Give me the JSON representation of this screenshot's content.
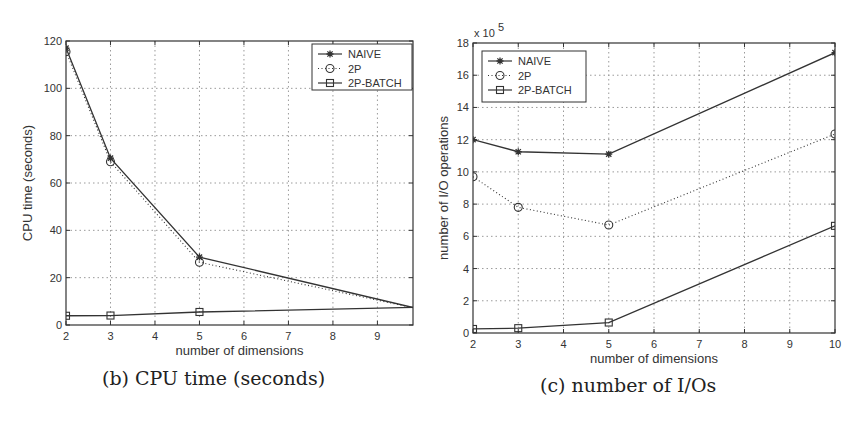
{
  "chart_data": [
    {
      "type": "line",
      "caption": "(b) CPU time (seconds)",
      "title": "",
      "xlabel": "number of dimensions",
      "ylabel": "CPU time (seconds)",
      "xlim": [
        2,
        9.8
      ],
      "ylim": [
        0,
        120
      ],
      "xticks": [
        2,
        3,
        4,
        5,
        6,
        7,
        8,
        9
      ],
      "yticks": [
        0,
        20,
        40,
        60,
        80,
        100,
        120
      ],
      "y_multiplier": "",
      "grid": true,
      "legend_position": "upper right",
      "x": [
        2,
        3,
        5,
        10
      ],
      "series": [
        {
          "name": "NAIVE",
          "marker": "asterisk",
          "line": "solid",
          "values": [
            117,
            70.5,
            28.7,
            6.5
          ]
        },
        {
          "name": "2P",
          "marker": "circle",
          "line": "dotted",
          "values": [
            115.5,
            69,
            26.5,
            6.5
          ]
        },
        {
          "name": "2P-BATCH",
          "marker": "square",
          "line": "solid",
          "values": [
            3.9,
            4.0,
            5.5,
            7.5
          ]
        }
      ]
    },
    {
      "type": "line",
      "caption": "(c) number of I/Os",
      "title": "",
      "xlabel": "number of dimensions",
      "ylabel": "number of I/O operations",
      "xlim": [
        2,
        10
      ],
      "ylim": [
        0,
        18
      ],
      "xticks": [
        2,
        3,
        4,
        5,
        6,
        7,
        8,
        9,
        10
      ],
      "yticks": [
        0,
        2,
        4,
        6,
        8,
        10,
        12,
        14,
        16,
        18
      ],
      "y_multiplier": "x 10^5",
      "grid": true,
      "legend_position": "upper left",
      "x": [
        2,
        3,
        5,
        10
      ],
      "series": [
        {
          "name": "NAIVE",
          "marker": "asterisk",
          "line": "solid",
          "values": [
            12.0,
            11.25,
            11.1,
            17.4
          ]
        },
        {
          "name": "2P",
          "marker": "circle",
          "line": "dotted",
          "values": [
            9.7,
            7.8,
            6.7,
            12.35
          ]
        },
        {
          "name": "2P-BATCH",
          "marker": "square",
          "line": "solid",
          "values": [
            0.25,
            0.3,
            0.65,
            6.65
          ]
        }
      ]
    }
  ],
  "layout": {
    "charts": [
      {
        "plot": {
          "left": 66,
          "top": 41,
          "right": 413,
          "bottom": 325
        },
        "xmax_data": 10,
        "legend": {
          "x": 312,
          "y": 44,
          "w": 100,
          "h": 46
        },
        "caption_pos": {
          "left": 102,
          "top": 367
        },
        "ylabel_x": 32
      },
      {
        "plot": {
          "left": 473,
          "top": 43,
          "right": 835,
          "bottom": 333
        },
        "xmax_data": 10,
        "legend": {
          "x": 482,
          "y": 51,
          "w": 104,
          "h": 51
        },
        "caption_pos": {
          "left": 540,
          "top": 374
        },
        "ylabel_x": 448
      }
    ],
    "colors": {
      "line": "#333333",
      "grid": "#9a9a9a",
      "axis": "#333333"
    }
  }
}
